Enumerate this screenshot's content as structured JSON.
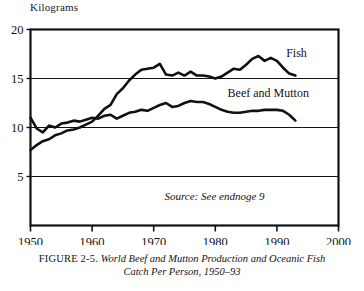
{
  "figure": {
    "y_axis_title": "Kilograms",
    "caption_prefix": "FIGURE 2-5.",
    "caption_text": "World Beef and Mutton Production and Oceanic Fish",
    "caption_text_line2": "Catch Per Person, 1950–93",
    "source_note": "Source: See endnoge 9",
    "ink_color": "#111111"
  },
  "chart_data": {
    "type": "line",
    "title": "World Beef and Mutton Production and Oceanic Fish Catch Per Person, 1950–93",
    "xlabel": "",
    "ylabel": "Kilograms",
    "xlim": [
      1950,
      2000
    ],
    "ylim": [
      0,
      20
    ],
    "xticks": [
      1950,
      1960,
      1970,
      1980,
      1990,
      2000
    ],
    "yticks": [
      5,
      10,
      15,
      20
    ],
    "ytick_labels": [
      "5",
      "10",
      "15",
      "20"
    ],
    "xtick_labels": [
      "1950",
      "1960",
      "1970",
      "1980",
      "1990",
      "2000"
    ],
    "grid": "horizontal",
    "legend": "inline-labels",
    "annotations": [
      {
        "text": "Fish",
        "x": 1991.5,
        "y": 17.2
      },
      {
        "text": "Beef and Mutton",
        "x": 1982.0,
        "y": 13.1
      },
      {
        "text": "Source: See endnoge 9",
        "x": 1988.0,
        "y": 2.6
      }
    ],
    "x": [
      1950,
      1951,
      1952,
      1953,
      1954,
      1955,
      1956,
      1957,
      1958,
      1959,
      1960,
      1961,
      1962,
      1963,
      1964,
      1965,
      1966,
      1967,
      1968,
      1969,
      1970,
      1971,
      1972,
      1973,
      1974,
      1975,
      1976,
      1977,
      1978,
      1979,
      1980,
      1981,
      1982,
      1983,
      1984,
      1985,
      1986,
      1987,
      1988,
      1989,
      1990,
      1991,
      1992,
      1993
    ],
    "series": [
      {
        "name": "Fish",
        "values": [
          7.7,
          8.2,
          8.6,
          8.8,
          9.2,
          9.4,
          9.7,
          9.8,
          10.0,
          10.3,
          10.6,
          11.2,
          11.9,
          12.3,
          13.4,
          14.0,
          14.8,
          15.4,
          15.9,
          16.0,
          16.1,
          16.5,
          15.4,
          15.3,
          15.6,
          15.3,
          15.7,
          15.3,
          15.3,
          15.2,
          15.0,
          15.2,
          15.6,
          16.0,
          15.9,
          16.4,
          17.0,
          17.3,
          16.8,
          17.1,
          16.8,
          16.1,
          15.5,
          15.3
        ]
      },
      {
        "name": "Beef and Mutton",
        "values": [
          11.0,
          9.9,
          9.5,
          10.2,
          10.0,
          10.4,
          10.5,
          10.7,
          10.6,
          10.8,
          11.0,
          10.9,
          11.2,
          11.3,
          10.9,
          11.2,
          11.5,
          11.6,
          11.8,
          11.7,
          12.0,
          12.3,
          12.5,
          12.1,
          12.2,
          12.5,
          12.7,
          12.6,
          12.6,
          12.4,
          12.1,
          11.8,
          11.6,
          11.5,
          11.5,
          11.6,
          11.7,
          11.7,
          11.8,
          11.8,
          11.8,
          11.7,
          11.3,
          10.7
        ]
      }
    ]
  }
}
